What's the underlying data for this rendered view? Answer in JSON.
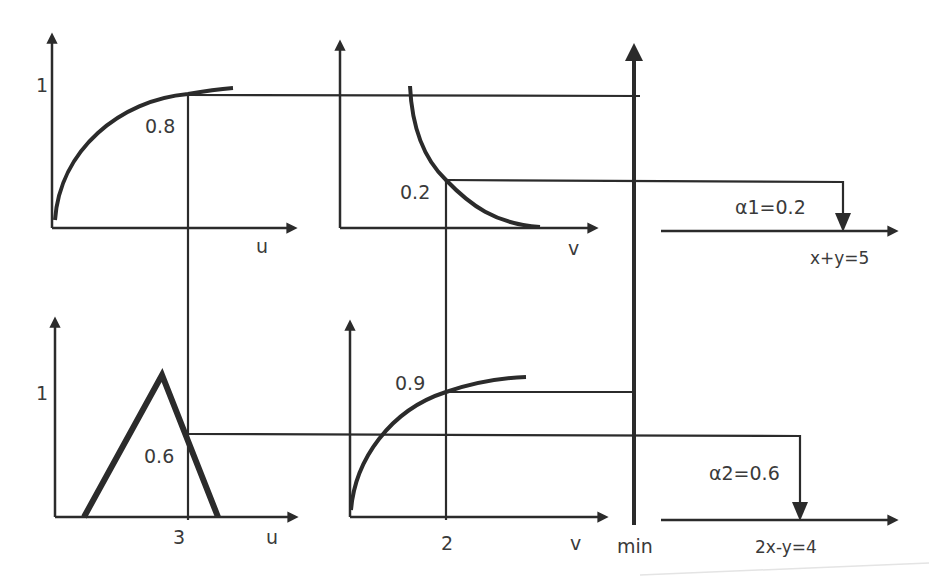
{
  "diagram": {
    "colors": {
      "stroke": "#2b2b2b",
      "text": "#3a3a3a",
      "background": "#ffffff"
    },
    "panels": [
      {
        "id": "top-left",
        "axis_x_label": "u",
        "axis_y_tick": "1",
        "curve": "increasing concave membership function",
        "intersection_label": "0.8"
      },
      {
        "id": "top-middle",
        "axis_x_label": "v",
        "curve": "decreasing convex membership function",
        "intersection_label": "0.2"
      },
      {
        "id": "bottom-left",
        "axis_x_label": "u",
        "axis_y_tick": "1",
        "curve": "triangular membership function",
        "x_tick": "3",
        "intersection_label": "0.6"
      },
      {
        "id": "bottom-middle",
        "axis_x_label": "v",
        "curve": "increasing concave membership function",
        "x_tick": "2",
        "intersection_label": "0.9"
      }
    ],
    "min_axis": {
      "label": "min"
    },
    "outputs": [
      {
        "id": "rule-1",
        "alpha_label": "α1=0.2",
        "consequent_label": "x+y=5"
      },
      {
        "id": "rule-2",
        "alpha_label": "α2=0.6",
        "consequent_label": "2x-y=4"
      }
    ]
  }
}
